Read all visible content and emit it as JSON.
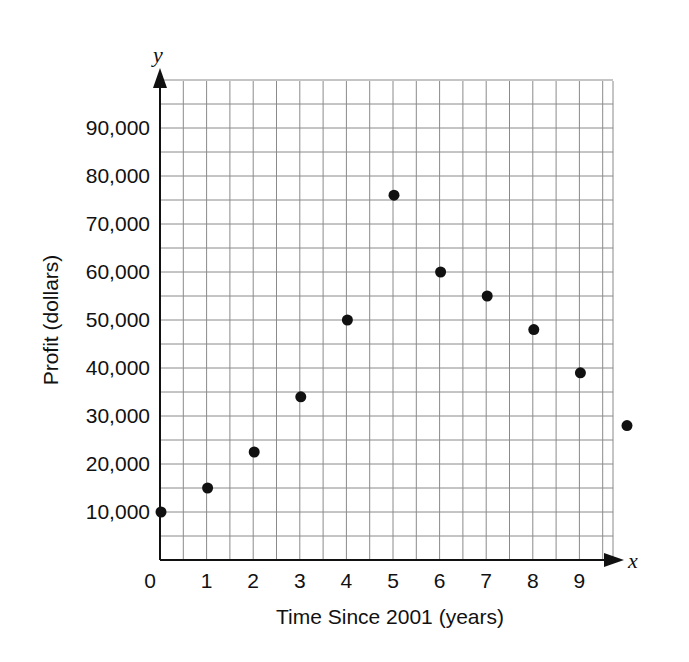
{
  "chart_data": {
    "type": "scatter",
    "title": "",
    "xlabel": "Time Since 2001 (years)",
    "ylabel": "Profit (dollars)",
    "x_axis_letter": "x",
    "y_axis_letter": "y",
    "x_tick_labels": [
      "0",
      "1",
      "2",
      "3",
      "4",
      "5",
      "6",
      "7",
      "8",
      "9"
    ],
    "y_tick_labels": [
      "10,000",
      "20,000",
      "30,000",
      "40,000",
      "50,000",
      "60,000",
      "70,000",
      "80,000",
      "90,000"
    ],
    "xlim": [
      0,
      10
    ],
    "ylim": [
      0,
      100000
    ],
    "grid": true,
    "grid_minor_x_step": 0.5,
    "grid_minor_y_step": 5000,
    "legend": null,
    "series": [
      {
        "name": "Profit",
        "x": [
          0,
          1,
          2,
          3,
          4,
          5,
          6,
          7,
          8,
          9,
          10
        ],
        "values": [
          10000,
          15000,
          22500,
          34000,
          50000,
          76000,
          60000,
          55000,
          48000,
          39000,
          28000
        ]
      }
    ]
  }
}
